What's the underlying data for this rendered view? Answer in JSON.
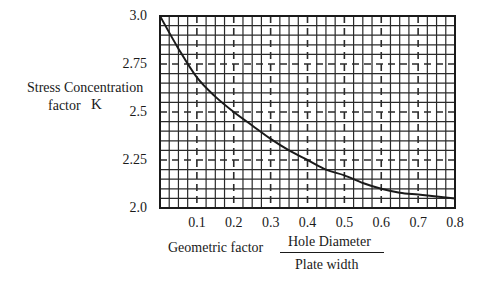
{
  "chart_data": {
    "type": "line",
    "title": "",
    "xlabel": "Geometric factor",
    "xlabel_fraction": {
      "numerator": "Hole Diameter",
      "denominator": "Plate width"
    },
    "ylabel": "Stress Concentration factor  K",
    "ylabel_lines": [
      "Stress Concentration",
      "factor"
    ],
    "ylabel_symbol": "K",
    "xlim": [
      0,
      0.8
    ],
    "ylim": [
      2.0,
      3.0
    ],
    "x_ticks": [
      "0.1",
      "0.2",
      "0.3",
      "0.4",
      "0.5",
      "0.6",
      "0.7",
      "0.8"
    ],
    "y_ticks": [
      "3.0",
      "2.75",
      "2.5",
      "2.25",
      "2.0"
    ],
    "grid": true,
    "grid_minor_x_step": 0.025,
    "grid_minor_y_step": 0.05,
    "grid_major_dashed_x": [
      0.1,
      0.2,
      0.3,
      0.4,
      0.5,
      0.6,
      0.7
    ],
    "grid_major_dashed_y": [
      2.25,
      2.5,
      2.75
    ],
    "legend": null,
    "series": [
      {
        "name": "K",
        "x": [
          0.0,
          0.05,
          0.1,
          0.15,
          0.2,
          0.25,
          0.3,
          0.35,
          0.4,
          0.45,
          0.5,
          0.55,
          0.6,
          0.65,
          0.7,
          0.75,
          0.8
        ],
        "values": [
          3.0,
          2.83,
          2.68,
          2.58,
          2.5,
          2.43,
          2.36,
          2.3,
          2.25,
          2.2,
          2.17,
          2.13,
          2.1,
          2.08,
          2.07,
          2.06,
          2.05
        ]
      }
    ]
  },
  "colors": {
    "line": "#1a1a1a",
    "grid": "#2a2a2a",
    "background": "#ffffff"
  }
}
